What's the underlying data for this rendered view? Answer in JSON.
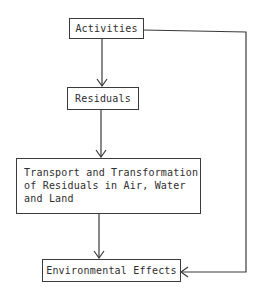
{
  "diagram": {
    "type": "flowchart",
    "nodes": [
      {
        "id": "activities",
        "label": "Activities"
      },
      {
        "id": "residuals",
        "label": "Residuals"
      },
      {
        "id": "transport",
        "lines": [
          "Transport and Transformation",
          "of Residuals in Air, Water",
          "and Land"
        ]
      },
      {
        "id": "effects",
        "label": "Environmental Effects"
      }
    ],
    "edges": [
      {
        "from": "activities",
        "to": "residuals"
      },
      {
        "from": "residuals",
        "to": "transport"
      },
      {
        "from": "transport",
        "to": "effects"
      },
      {
        "from": "activities",
        "to": "effects",
        "route": "right-side bypass"
      }
    ],
    "colors": {
      "line": "#3a3a3a",
      "text": "#2e2e2e",
      "background": "#ffffff"
    }
  }
}
